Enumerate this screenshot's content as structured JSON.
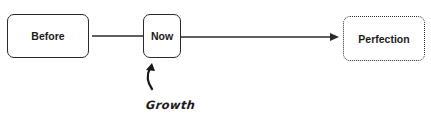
{
  "diagram": {
    "type": "flow",
    "nodes": [
      {
        "id": "before",
        "label": "Before",
        "style": "solid"
      },
      {
        "id": "now",
        "label": "Now",
        "style": "solid"
      },
      {
        "id": "perfection",
        "label": "Perfection",
        "style": "dotted"
      }
    ],
    "edges": [
      {
        "from": "before",
        "to": "now",
        "arrow": false
      },
      {
        "from": "now",
        "to": "perfection",
        "arrow": true
      }
    ],
    "annotation": {
      "label": "Growth",
      "points_to": "now",
      "icon": "curved-arrow-up-icon"
    },
    "colors": {
      "stroke": "#2a2a2a",
      "text": "#1a1a1a",
      "background": "#ffffff"
    }
  }
}
